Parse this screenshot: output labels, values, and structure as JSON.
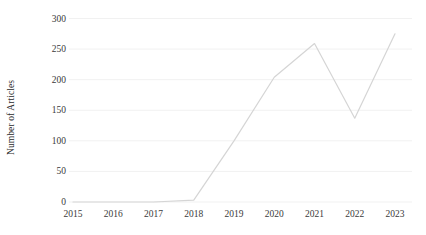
{
  "chart_data": {
    "type": "line",
    "title": "",
    "subtitle": "",
    "xlabel": "",
    "ylabel": "Number of Articles",
    "categories": [
      "2015",
      "2016",
      "2017",
      "2018",
      "2019",
      "2020",
      "2021",
      "2022",
      "2023"
    ],
    "values": [
      0,
      0,
      0,
      3,
      100,
      204,
      259,
      137,
      275
    ],
    "series": [
      {
        "name": "Number of Articles",
        "values": [
          0,
          0,
          0,
          3,
          100,
          204,
          259,
          137,
          275
        ]
      }
    ],
    "ylim": [
      0,
      300
    ],
    "yticks": [
      0,
      50,
      100,
      150,
      200,
      250,
      300
    ],
    "ytick_labels": [
      "0",
      "50",
      "100",
      "150",
      "200",
      "250",
      "300"
    ],
    "xtick_labels": [
      "2015",
      "2016",
      "2017",
      "2018",
      "2019",
      "2020",
      "2021",
      "2022",
      "2023"
    ],
    "grid": true,
    "grid_axis": "y",
    "legend": false,
    "legend_position": "none",
    "annotations": [],
    "colors": {
      "line": "#d5d5d5",
      "grid": "#f1f1f1",
      "tick_text": "#3a3a3a",
      "axis_title": "#2b2b2b",
      "background": "#ffffff"
    },
    "line_width": 1.2,
    "markers": false
  },
  "figure": {
    "y_axis_title": "Number of Articles"
  }
}
